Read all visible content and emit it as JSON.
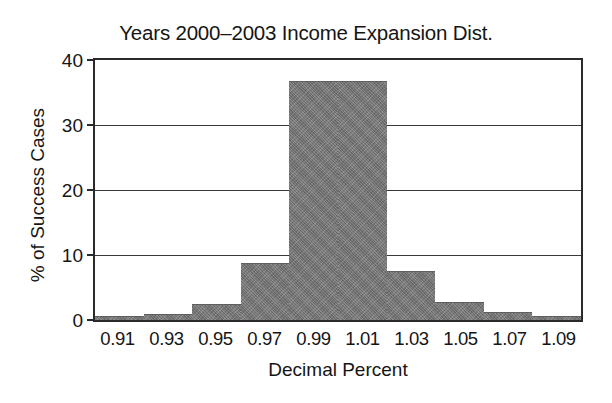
{
  "chart_data": {
    "type": "bar",
    "title": "Years 2000–2003 Income Expansion Dist.",
    "xlabel": "Decimal Percent",
    "ylabel": "% of Success Cases",
    "categories": [
      "0.91",
      "0.93",
      "0.95",
      "0.97",
      "0.99",
      "1.01",
      "1.03",
      "1.05",
      "1.07",
      "1.09"
    ],
    "values": [
      0.6,
      1.0,
      2.4,
      8.8,
      36.7,
      36.7,
      7.6,
      2.7,
      1.2,
      0.6
    ],
    "ylim": [
      0,
      40
    ],
    "yticks": [
      0,
      10,
      20,
      30,
      40
    ],
    "ytick_labels": [
      "0",
      "10",
      "20",
      "30",
      "40"
    ],
    "grid": true,
    "grid_axis": "y",
    "legend": false,
    "bar_color": "#7c7c7c",
    "axis_color": "#2a2a2a",
    "background": "#ffffff"
  }
}
